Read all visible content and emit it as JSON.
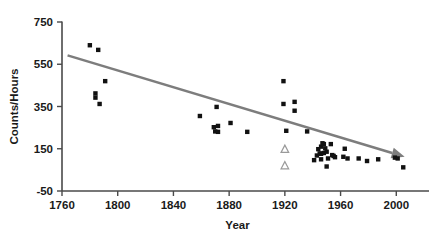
{
  "chart_data": {
    "type": "scatter",
    "title": "",
    "xlabel": "Year",
    "ylabel": "Counts/Hours",
    "xlim": [
      1760,
      2012
    ],
    "ylim": [
      -50,
      750
    ],
    "xticks": [
      1760,
      1800,
      1840,
      1880,
      1920,
      1960,
      2000
    ],
    "xtick_labels": [
      "1760",
      "1800",
      "1840",
      "1880",
      "1920",
      "1960",
      "2000"
    ],
    "yticks": [
      -50,
      150,
      350,
      550,
      750
    ],
    "ytick_labels": [
      "-50",
      "150",
      "350",
      "550",
      "750"
    ],
    "grid": false,
    "legend": null,
    "series": [
      {
        "name": "observations",
        "marker": "filled-square",
        "color": "#111111",
        "points": [
          [
            1780,
            640
          ],
          [
            1786,
            618
          ],
          [
            1791,
            470
          ],
          [
            1784,
            412
          ],
          [
            1784,
            392
          ],
          [
            1787,
            362
          ],
          [
            1859,
            305
          ],
          [
            1871,
            348
          ],
          [
            1869,
            252
          ],
          [
            1872,
            258
          ],
          [
            1870,
            232
          ],
          [
            1872,
            230
          ],
          [
            1881,
            272
          ],
          [
            1893,
            230
          ],
          [
            1919,
            470
          ],
          [
            1919,
            362
          ],
          [
            1927,
            372
          ],
          [
            1927,
            330
          ],
          [
            1921,
            235
          ],
          [
            1936,
            232
          ],
          [
            1944,
            148
          ],
          [
            1946,
            160
          ],
          [
            1947,
            176
          ],
          [
            1948,
            172
          ],
          [
            1949,
            152
          ],
          [
            1945,
            128
          ],
          [
            1946,
            126
          ],
          [
            1948,
            130
          ],
          [
            1950,
            136
          ],
          [
            1943,
            118
          ],
          [
            1941,
            96
          ],
          [
            1946,
            100
          ],
          [
            1951,
            104
          ],
          [
            1953,
            172
          ],
          [
            1954,
            120
          ],
          [
            1955,
            116
          ],
          [
            1956,
            110
          ],
          [
            1950,
            66
          ],
          [
            1963,
            150
          ],
          [
            1962,
            112
          ],
          [
            1965,
            104
          ],
          [
            1973,
            104
          ],
          [
            1979,
            92
          ],
          [
            1987,
            100
          ],
          [
            1999,
            108
          ],
          [
            2001,
            104
          ],
          [
            2005,
            62
          ]
        ]
      },
      {
        "name": "open-markers",
        "marker": "open-triangle",
        "color": "#9a9a9a",
        "points": [
          [
            1920,
            150
          ],
          [
            1920,
            72
          ]
        ]
      }
    ],
    "trendline": {
      "name": "declining-trend",
      "color": "#7d7d7d",
      "start": [
        1764,
        592
      ],
      "end": [
        2006,
        112
      ],
      "arrowhead": true
    }
  }
}
